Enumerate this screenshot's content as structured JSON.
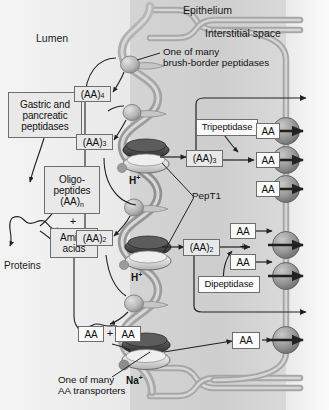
{
  "figure": {
    "type": "cell-transport-diagram"
  },
  "regions": {
    "lumen": "Lumen",
    "epithelium": "Epithelium",
    "interstitial": "Interstitial space"
  },
  "notes": {
    "brush_border_line1": "One of many",
    "brush_border_line2": "brush-border peptidases",
    "aa_transporter_line1": "One of many",
    "aa_transporter_line2": "AA transporters",
    "pept1": "PepT1"
  },
  "boxes": {
    "gastric": "Gastric and pancreatic peptidases",
    "gastric_l1": "Gastric and",
    "gastric_l2": "pancreatic",
    "gastric_l3": "peptidases",
    "oligo_l1": "Oligo-",
    "oligo_l2": "peptides",
    "oligo_l3": "(AA)",
    "oligo_sub": "n",
    "amino_l1": "Amino",
    "amino_l2": "acids",
    "proteins": "Proteins",
    "plus_symbol": "+",
    "aa4": "(AA)",
    "aa4_sub": "4",
    "aa3_lumen": "(AA)",
    "aa3_lumen_sub": "3",
    "aa2_lumen": "(AA)",
    "aa2_lumen_sub": "2",
    "aa3_cell": "(AA)",
    "aa3_cell_sub": "3",
    "aa2_cell": "(AA)",
    "aa2_cell_sub": "2",
    "aa": "AA",
    "tripeptidase": "Tripeptidase",
    "dipeptidase": "Dipeptidase"
  },
  "ions": {
    "h_upper": "H",
    "h_upper_sup": "+",
    "h_lower": "H",
    "h_lower_sup": "+",
    "na": "Na",
    "na_sup": "+"
  },
  "colors": {
    "membrane": "#9a9a9a",
    "membrane_core": "#cfcfcf",
    "lumen_bg": "#f0f0f0",
    "cell_bg": "#d9d9d9",
    "interstitial_bg": "#f2f2f2",
    "box_fill": "#e9e9e9",
    "box_stroke": "#6e6e6e",
    "arrow": "#2b2b2b",
    "transporter": "#8e8e8e",
    "ion_dot": "#8a8a8a"
  }
}
